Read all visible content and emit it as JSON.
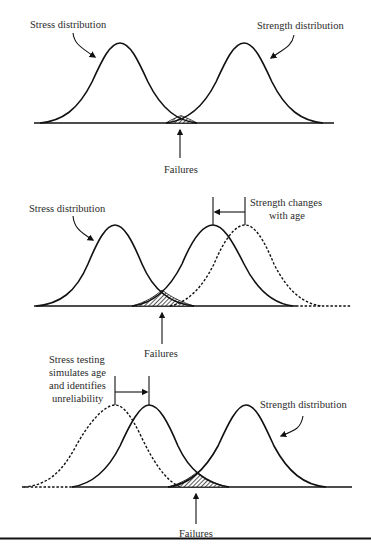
{
  "figure": {
    "panels": [
      {
        "id": "baseline",
        "labels": {
          "stress": "Stress distribution",
          "strength": "Strength distribution",
          "failures": "Failures"
        }
      },
      {
        "id": "aging",
        "labels": {
          "stress": "Stress distribution",
          "shift_line1": "Strength changes",
          "shift_line2": "with age",
          "failures": "Failures"
        }
      },
      {
        "id": "stress-testing",
        "labels": {
          "shift_line1": "Stress testing",
          "shift_line2": "simulates age",
          "shift_line3": "and identifies",
          "shift_line4": "unreliability",
          "strength": "Strength distribution",
          "failures": "Failures"
        }
      }
    ],
    "colors": {
      "stroke": "#111111",
      "text": "#2a2a2a",
      "background": "#ffffff"
    }
  }
}
